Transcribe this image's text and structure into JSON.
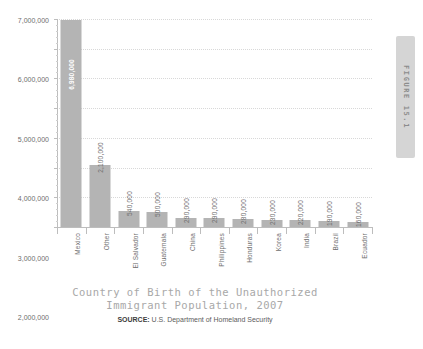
{
  "figure_tab": {
    "label": "FIGURE 15.1"
  },
  "caption": {
    "title_line1": "Country of Birth of the Unauthorized",
    "title_line2": "Immigrant Population, 2007",
    "source_label": "SOURCE:",
    "source_text": " U.S. Department of Homeland Security"
  },
  "colors": {
    "bar_fill": "#b4b4b4",
    "axis": "#bdbdbd",
    "gridline": "#d8d8d8",
    "title_text": "#a8a8a8",
    "tab_fill": "#d5d5d5"
  },
  "chart_data": {
    "type": "bar",
    "title": "Country of Birth of the Unauthorized Immigrant Population, 2007",
    "xlabel": "",
    "ylabel": "",
    "ylim": [
      0,
      7000000
    ],
    "ytick_step": 1000000,
    "grid": true,
    "legend": false,
    "orientation": "vertical",
    "ytick_labels": [
      "0",
      "1,000,000",
      "2,000,000",
      "3,000,000",
      "4,000,000",
      "5,000,000",
      "6,000,000",
      "7,000,000"
    ],
    "ytick_values": [
      0,
      1000000,
      2000000,
      3000000,
      4000000,
      5000000,
      6000000,
      7000000
    ],
    "categories": [
      "Mexico",
      "Other",
      "El Salvador",
      "Guatemala",
      "China",
      "Philippines",
      "Honduras",
      "Korea",
      "India",
      "Brazil",
      "Ecuador"
    ],
    "values": [
      6980000,
      2100000,
      540000,
      500000,
      290000,
      290000,
      280000,
      230000,
      220000,
      190000,
      160000
    ],
    "value_labels": [
      "6,980,000",
      "2,100,000",
      "540,000",
      "500,000",
      "290,000",
      "290,000",
      "280,000",
      "230,000",
      "220,000",
      "190,000",
      "160,000"
    ],
    "label_placement": [
      "inside",
      "outside",
      "outside",
      "outside",
      "outside",
      "outside",
      "outside",
      "outside",
      "outside",
      "outside",
      "outside"
    ]
  }
}
